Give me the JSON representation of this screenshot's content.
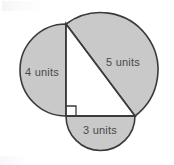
{
  "figure": {
    "colors": {
      "fill": "#c9c9c9",
      "stroke": "#3a3a3a",
      "triangle_fill": "#ffffff",
      "label_color": "#4a4a4a",
      "background": "#ffffff"
    },
    "triangle": {
      "vertices": {
        "top": {
          "x": 66,
          "y": 24
        },
        "right_angle": {
          "x": 66,
          "y": 116
        },
        "right": {
          "x": 135,
          "y": 116
        }
      },
      "right_angle_marker": {
        "x": 66,
        "y": 116,
        "size": 10
      }
    },
    "semicircles": [
      {
        "name": "vertical-leg-semicircle",
        "label": "4 units",
        "label_x": 42,
        "label_y": 73,
        "side": "left",
        "measure": 4
      },
      {
        "name": "hypotenuse-semicircle",
        "label": "5 units",
        "label_x": 123,
        "label_y": 63,
        "side": "upper-right",
        "measure": 5
      },
      {
        "name": "horizontal-leg-semicircle",
        "label": "3 units",
        "label_x": 100,
        "label_y": 131,
        "side": "bottom",
        "measure": 3
      }
    ]
  }
}
